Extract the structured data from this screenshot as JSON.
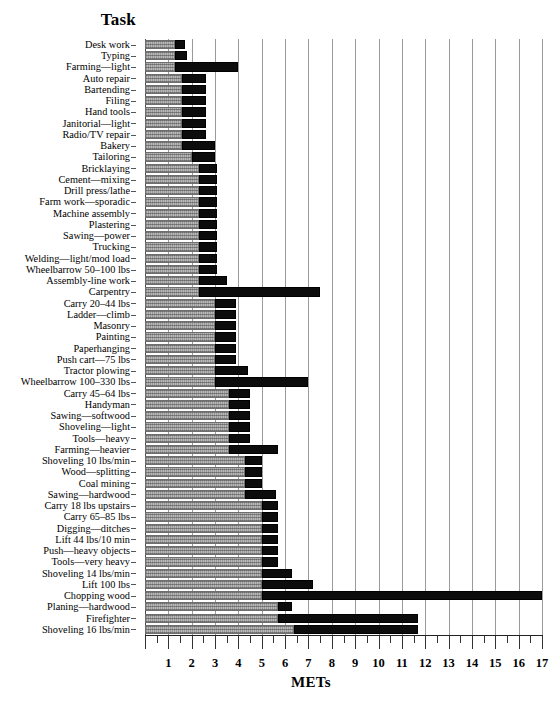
{
  "header": {
    "task_column_title": "Task"
  },
  "axis": {
    "x_title": "METs",
    "tick_labels": [
      "1",
      "2",
      "3",
      "4",
      "5",
      "6",
      "7",
      "8",
      "9",
      "10",
      "11",
      "12",
      "13",
      "14",
      "15",
      "16",
      "17"
    ],
    "x_min": 0,
    "x_max": 17,
    "minor_tick_step": 0.5
  },
  "legend_colors": {
    "light_band": "#b8b8b8",
    "dark_band": "#0c0c0c",
    "gridline": "#9a9a9a"
  },
  "chart_data": {
    "type": "bar",
    "orientation": "horizontal",
    "title": "",
    "xlabel": "METs",
    "ylabel": "Task",
    "xlim": [
      0,
      17
    ],
    "grid": true,
    "legend": "none",
    "series": [
      {
        "name": "light-range",
        "description": "light stippled segment (low-to-mid MET span)"
      },
      {
        "name": "heavy-range",
        "description": "solid black segment (mid-to-high MET span)"
      }
    ],
    "categories": [
      "Desk work",
      "Typing",
      "Farming—light",
      "Auto repair",
      "Bartending",
      "Filing",
      "Hand tools",
      "Janitorial—light",
      "Radio/TV repair",
      "Bakery",
      "Tailoring",
      "Bricklaying",
      "Cement—mixing",
      "Drill press/lathe",
      "Farm work—sporadic",
      "Machine assembly",
      "Plastering",
      "Sawing—power",
      "Trucking",
      "Welding—light/mod load",
      "Wheelbarrow 50–100 lbs",
      "Assembly-line work",
      "Carpentry",
      "Carry 20–44 lbs",
      "Ladder—climb",
      "Masonry",
      "Painting",
      "Paperhanging",
      "Push cart—75 lbs",
      "Tractor plowing",
      "Wheelbarrow 100–330 lbs",
      "Carry 45–64 lbs",
      "Handyman",
      "Sawing—softwood",
      "Shoveling—light",
      "Tools—heavy",
      "Farming—heavier",
      "Shoveling 10 lbs/min",
      "Wood—splitting",
      "Coal mining",
      "Sawing—hardwood",
      "Carry 18 lbs upstairs",
      "Carry 65–85 lbs",
      "Digging—ditches",
      "Lift 44 lbs/10 min",
      "Push—heavy objects",
      "Tools—very heavy",
      "Shoveling  14 lbs/min",
      "Lift 100 lbs",
      "Chopping wood",
      "Planing—hardwood",
      "Firefighter",
      "Shoveling 16 lbs/min"
    ],
    "bars": [
      {
        "task": "Desk work",
        "light_start": 0.0,
        "light_end": 1.3,
        "dark_start": 1.3,
        "dark_end": 1.7
      },
      {
        "task": "Typing",
        "light_start": 0.0,
        "light_end": 1.3,
        "dark_start": 1.3,
        "dark_end": 1.8
      },
      {
        "task": "Farming—light",
        "light_start": 0.0,
        "light_end": 1.3,
        "dark_start": 1.3,
        "dark_end": 4.0
      },
      {
        "task": "Auto repair",
        "light_start": 0.0,
        "light_end": 1.6,
        "dark_start": 1.6,
        "dark_end": 2.6
      },
      {
        "task": "Bartending",
        "light_start": 0.0,
        "light_end": 1.6,
        "dark_start": 1.6,
        "dark_end": 2.6
      },
      {
        "task": "Filing",
        "light_start": 0.0,
        "light_end": 1.6,
        "dark_start": 1.6,
        "dark_end": 2.6
      },
      {
        "task": "Hand tools",
        "light_start": 0.0,
        "light_end": 1.6,
        "dark_start": 1.6,
        "dark_end": 2.6
      },
      {
        "task": "Janitorial—light",
        "light_start": 0.0,
        "light_end": 1.6,
        "dark_start": 1.6,
        "dark_end": 2.6
      },
      {
        "task": "Radio/TV repair",
        "light_start": 0.0,
        "light_end": 1.6,
        "dark_start": 1.6,
        "dark_end": 2.6
      },
      {
        "task": "Bakery",
        "light_start": 0.0,
        "light_end": 1.6,
        "dark_start": 1.6,
        "dark_end": 3.0
      },
      {
        "task": "Tailoring",
        "light_start": 0.0,
        "light_end": 2.0,
        "dark_start": 2.0,
        "dark_end": 3.0
      },
      {
        "task": "Bricklaying",
        "light_start": 0.0,
        "light_end": 2.3,
        "dark_start": 2.3,
        "dark_end": 3.1
      },
      {
        "task": "Cement—mixing",
        "light_start": 0.0,
        "light_end": 2.3,
        "dark_start": 2.3,
        "dark_end": 3.1
      },
      {
        "task": "Drill press/lathe",
        "light_start": 0.0,
        "light_end": 2.3,
        "dark_start": 2.3,
        "dark_end": 3.1
      },
      {
        "task": "Farm work—sporadic",
        "light_start": 0.0,
        "light_end": 2.3,
        "dark_start": 2.3,
        "dark_end": 3.1
      },
      {
        "task": "Machine assembly",
        "light_start": 0.0,
        "light_end": 2.3,
        "dark_start": 2.3,
        "dark_end": 3.1
      },
      {
        "task": "Plastering",
        "light_start": 0.0,
        "light_end": 2.3,
        "dark_start": 2.3,
        "dark_end": 3.1
      },
      {
        "task": "Sawing—power",
        "light_start": 0.0,
        "light_end": 2.3,
        "dark_start": 2.3,
        "dark_end": 3.1
      },
      {
        "task": "Trucking",
        "light_start": 0.0,
        "light_end": 2.3,
        "dark_start": 2.3,
        "dark_end": 3.1
      },
      {
        "task": "Welding—light/mod load",
        "light_start": 0.0,
        "light_end": 2.3,
        "dark_start": 2.3,
        "dark_end": 3.1
      },
      {
        "task": "Wheelbarrow 50–100 lbs",
        "light_start": 0.0,
        "light_end": 2.3,
        "dark_start": 2.3,
        "dark_end": 3.1
      },
      {
        "task": "Assembly-line work",
        "light_start": 0.0,
        "light_end": 2.3,
        "dark_start": 2.3,
        "dark_end": 3.5
      },
      {
        "task": "Carpentry",
        "light_start": 0.0,
        "light_end": 2.3,
        "dark_start": 2.3,
        "dark_end": 7.5
      },
      {
        "task": "Carry 20–44 lbs",
        "light_start": 0.0,
        "light_end": 3.0,
        "dark_start": 3.0,
        "dark_end": 3.9
      },
      {
        "task": "Ladder—climb",
        "light_start": 0.0,
        "light_end": 3.0,
        "dark_start": 3.0,
        "dark_end": 3.9
      },
      {
        "task": "Masonry",
        "light_start": 0.0,
        "light_end": 3.0,
        "dark_start": 3.0,
        "dark_end": 3.9
      },
      {
        "task": "Painting",
        "light_start": 0.0,
        "light_end": 3.0,
        "dark_start": 3.0,
        "dark_end": 3.9
      },
      {
        "task": "Paperhanging",
        "light_start": 0.0,
        "light_end": 3.0,
        "dark_start": 3.0,
        "dark_end": 3.9
      },
      {
        "task": "Push cart—75 lbs",
        "light_start": 0.0,
        "light_end": 3.0,
        "dark_start": 3.0,
        "dark_end": 3.9
      },
      {
        "task": "Tractor plowing",
        "light_start": 0.0,
        "light_end": 3.0,
        "dark_start": 3.0,
        "dark_end": 4.4
      },
      {
        "task": "Wheelbarrow 100–330 lbs",
        "light_start": 0.0,
        "light_end": 3.0,
        "dark_start": 3.0,
        "dark_end": 7.0
      },
      {
        "task": "Carry 45–64 lbs",
        "light_start": 0.0,
        "light_end": 3.6,
        "dark_start": 3.6,
        "dark_end": 4.5
      },
      {
        "task": "Handyman",
        "light_start": 0.0,
        "light_end": 3.6,
        "dark_start": 3.6,
        "dark_end": 4.5
      },
      {
        "task": "Sawing—softwood",
        "light_start": 0.0,
        "light_end": 3.6,
        "dark_start": 3.6,
        "dark_end": 4.5
      },
      {
        "task": "Shoveling—light",
        "light_start": 0.0,
        "light_end": 3.6,
        "dark_start": 3.6,
        "dark_end": 4.5
      },
      {
        "task": "Tools—heavy",
        "light_start": 0.0,
        "light_end": 3.6,
        "dark_start": 3.6,
        "dark_end": 4.5
      },
      {
        "task": "Farming—heavier",
        "light_start": 0.0,
        "light_end": 3.6,
        "dark_start": 3.6,
        "dark_end": 5.7
      },
      {
        "task": "Shoveling 10 lbs/min",
        "light_start": 0.0,
        "light_end": 4.3,
        "dark_start": 4.3,
        "dark_end": 5.0
      },
      {
        "task": "Wood—splitting",
        "light_start": 0.0,
        "light_end": 4.3,
        "dark_start": 4.3,
        "dark_end": 5.0
      },
      {
        "task": "Coal mining",
        "light_start": 0.0,
        "light_end": 4.3,
        "dark_start": 4.3,
        "dark_end": 5.0
      },
      {
        "task": "Sawing—hardwood",
        "light_start": 0.0,
        "light_end": 4.3,
        "dark_start": 4.3,
        "dark_end": 5.6
      },
      {
        "task": "Carry 18 lbs upstairs",
        "light_start": 0.0,
        "light_end": 5.0,
        "dark_start": 5.0,
        "dark_end": 5.7
      },
      {
        "task": "Carry 65–85 lbs",
        "light_start": 0.0,
        "light_end": 5.0,
        "dark_start": 5.0,
        "dark_end": 5.7
      },
      {
        "task": "Digging—ditches",
        "light_start": 0.0,
        "light_end": 5.0,
        "dark_start": 5.0,
        "dark_end": 5.7
      },
      {
        "task": "Lift 44 lbs/10 min",
        "light_start": 0.0,
        "light_end": 5.0,
        "dark_start": 5.0,
        "dark_end": 5.7
      },
      {
        "task": "Push—heavy objects",
        "light_start": 0.0,
        "light_end": 5.0,
        "dark_start": 5.0,
        "dark_end": 5.7
      },
      {
        "task": "Tools—very heavy",
        "light_start": 0.0,
        "light_end": 5.0,
        "dark_start": 5.0,
        "dark_end": 5.7
      },
      {
        "task": "Shoveling  14 lbs/min",
        "light_start": 0.0,
        "light_end": 5.0,
        "dark_start": 5.0,
        "dark_end": 6.3
      },
      {
        "task": "Lift 100 lbs",
        "light_start": 0.0,
        "light_end": 5.0,
        "dark_start": 5.0,
        "dark_end": 7.2
      },
      {
        "task": "Chopping wood",
        "light_start": 0.0,
        "light_end": 5.0,
        "dark_start": 5.0,
        "dark_end": 17.0
      },
      {
        "task": "Planing—hardwood",
        "light_start": 0.0,
        "light_end": 5.7,
        "dark_start": 5.7,
        "dark_end": 6.3
      },
      {
        "task": "Firefighter",
        "light_start": 0.0,
        "light_end": 5.7,
        "dark_start": 5.7,
        "dark_end": 11.7
      },
      {
        "task": "Shoveling 16 lbs/min",
        "light_start": 0.0,
        "light_end": 6.4,
        "dark_start": 6.4,
        "dark_end": 11.7
      }
    ]
  }
}
